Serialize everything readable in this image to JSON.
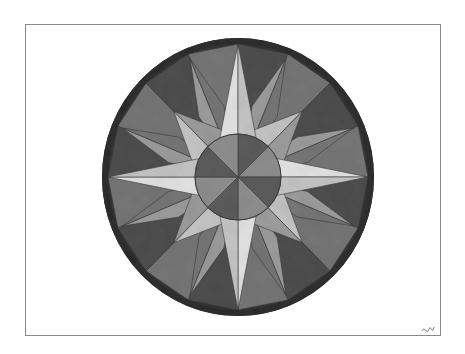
{
  "artwork": {
    "subject": "Compass rose painting",
    "medium_look": "grayscale watercolor",
    "canvas": {
      "width": 465,
      "height": 354,
      "background": "#ffffff"
    },
    "frame": {
      "x": 25,
      "y": 24,
      "width": 416,
      "height": 312,
      "border_color": "#8a8a8a"
    },
    "compass": {
      "center": {
        "x": 238,
        "y": 177
      },
      "outer_radius_x": 136,
      "outer_radius_y": 139,
      "rim_width": 6,
      "rim_color": "#2e2e2e",
      "inner_circle_radius": 43,
      "cardinal_point_radius": 133,
      "cardinal_point_half_width": 22,
      "diagonal_point_radius": 93,
      "diagonal_point_half_width": 20,
      "secondary_point_radius": 128,
      "secondary_point_half_width": 10,
      "line_color": "#3a3a3a"
    },
    "tones": {
      "light": "#e2e2e2",
      "light_mid": "#c4c4c4",
      "mid": "#9c9c9c",
      "mid_dark": "#767676",
      "dark": "#4e4e4e",
      "darkest": "#353535",
      "inner_light": "#8e8e8e",
      "inner_dark": "#5c5c5c"
    },
    "signature": {
      "x": 421,
      "y": 324,
      "color": "#7a7a7a"
    }
  }
}
